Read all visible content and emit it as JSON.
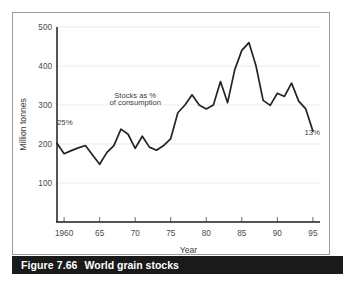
{
  "figure": {
    "caption_number": "Figure 7.66",
    "caption_title": "World grain stocks",
    "caption_bar_color": "#1a1a1a",
    "frame_color": "#9a9a9a",
    "background_color": "#ffffff"
  },
  "chart_data": {
    "type": "line",
    "title": "World grain stocks",
    "xlabel": "Year",
    "ylabel": "Million tonnes",
    "xlim": [
      1959,
      1996
    ],
    "ylim": [
      0,
      500
    ],
    "grid": true,
    "legend_position": "none",
    "line_color": "#232323",
    "y_ticks": [
      100,
      200,
      300,
      400,
      500
    ],
    "y_tick_labels": [
      "100",
      "200",
      "300",
      "400",
      "500"
    ],
    "x_ticks": [
      1960,
      1965,
      1970,
      1975,
      1980,
      1985,
      1990,
      1995
    ],
    "x_tick_labels": [
      "1960",
      "65",
      "70",
      "75",
      "80",
      "85",
      "90",
      "95"
    ],
    "series": [
      {
        "name": "World grain stocks",
        "x": [
          1959,
          1960,
          1961,
          1962,
          1963,
          1964,
          1965,
          1966,
          1967,
          1968,
          1969,
          1970,
          1971,
          1972,
          1973,
          1974,
          1975,
          1976,
          1977,
          1978,
          1979,
          1980,
          1981,
          1982,
          1983,
          1984,
          1985,
          1986,
          1987,
          1988,
          1989,
          1990,
          1991,
          1992,
          1993,
          1994,
          1995
        ],
        "values": [
          202,
          175,
          183,
          190,
          196,
          172,
          148,
          178,
          196,
          238,
          225,
          189,
          220,
          192,
          184,
          196,
          214,
          280,
          300,
          326,
          300,
          290,
          300,
          360,
          306,
          390,
          440,
          460,
          400,
          312,
          299,
          330,
          322,
          356,
          310,
          290,
          233
        ]
      }
    ],
    "annotations": [
      {
        "id": "start-pct",
        "text": "25%",
        "x": 1959,
        "y": 248
      },
      {
        "id": "end-pct",
        "text": "13%",
        "x": 1996,
        "y": 222
      },
      {
        "id": "series-callout-line1",
        "text": "Stocks as %",
        "x": 1970,
        "y": 318
      },
      {
        "id": "series-callout-line2",
        "text": "of consumption",
        "x": 1970,
        "y": 300
      }
    ]
  }
}
